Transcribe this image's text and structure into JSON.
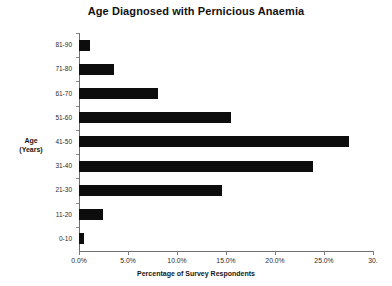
{
  "chart_data": {
    "type": "bar",
    "orientation": "horizontal",
    "title": "Age Diagnosed with Pernicious Anaemia",
    "xlabel": "Percentage of Survey Respondents",
    "ylabel_lines": [
      "Age",
      "(Years)"
    ],
    "categories": [
      "0-10",
      "11-20",
      "21-30",
      "31-40",
      "41-50",
      "51-60",
      "61-70",
      "71-80",
      "81-90"
    ],
    "values": [
      0.5,
      2.4,
      14.6,
      23.9,
      27.5,
      15.5,
      8.1,
      3.6,
      1.1
    ],
    "xlim": [
      0,
      30
    ],
    "xticks": [
      0,
      5,
      10,
      15,
      20,
      25,
      30
    ],
    "xtick_labels": [
      "0.0%",
      "5.0%",
      "10.0%",
      "15.0%",
      "20.0%",
      "25.0%",
      "30."
    ],
    "grid": false,
    "legend": false,
    "bar_color": "#0d0d0d",
    "axis_color": "#6e6e6e",
    "background": "#ffffff"
  }
}
